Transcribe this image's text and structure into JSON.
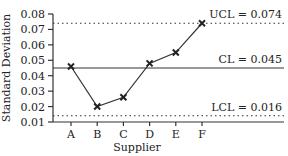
{
  "chart_data": {
    "type": "line",
    "title": "",
    "xlabel": "Supplier",
    "ylabel": "Standard Deviation",
    "categories": [
      "A",
      "B",
      "C",
      "D",
      "E",
      "F"
    ],
    "series": [
      {
        "name": "Standard Deviation",
        "values": [
          0.046,
          0.02,
          0.026,
          0.048,
          0.055,
          0.074
        ]
      }
    ],
    "ylim": [
      0.01,
      0.08
    ],
    "yticks": [
      "0.08",
      "0.07",
      "0.06",
      "0.05",
      "0.04",
      "0.03",
      "0.02",
      "0.01"
    ],
    "reference_lines": [
      {
        "name": "UCL",
        "value": 0.074,
        "label": "UCL = 0.074",
        "style": "dotted"
      },
      {
        "name": "CL",
        "value": 0.045,
        "label": "CL = 0.045",
        "style": "solid"
      },
      {
        "name": "LCL",
        "value": 0.016,
        "label": "LCL = 0.016",
        "style": "dotted"
      }
    ],
    "marker": "x",
    "grid": false,
    "legend": "none"
  }
}
